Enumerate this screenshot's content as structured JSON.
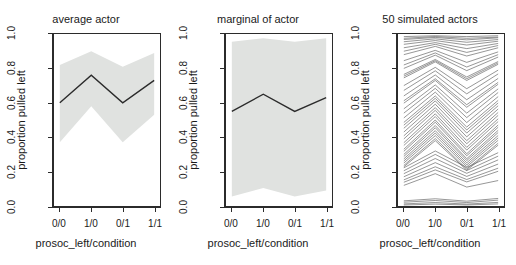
{
  "figure": {
    "background": "#ffffff",
    "line_color": "#2b2b2b",
    "band_color": "#e0e2e0",
    "spaghetti_color": "#4d4d4d"
  },
  "panels": [
    {
      "id": "average-actor",
      "title": "average actor",
      "xlabel": "prosoc_left/condition",
      "ylabel": "proportion pulled left"
    },
    {
      "id": "marginal-of-actor",
      "title": "marginal of actor",
      "xlabel": "prosoc_left/condition",
      "ylabel": "proportion pulled left"
    },
    {
      "id": "simulated-actors",
      "title": "50 simulated actors",
      "xlabel": "prosoc_left/condition",
      "ylabel": "proportion pulled left"
    }
  ],
  "axes": {
    "ytick_labels": [
      "0.0",
      "0.2",
      "0.4",
      "0.6",
      "0.8",
      "1.0"
    ],
    "ytick_values": [
      0.0,
      0.2,
      0.4,
      0.6,
      0.8,
      1.0
    ],
    "xtick_labels": [
      "0/0",
      "1/0",
      "0/1",
      "1/1"
    ],
    "ylim": [
      0.0,
      1.0
    ],
    "grid": false,
    "legend": "none"
  },
  "chart_data": [
    {
      "type": "line",
      "title": "average actor",
      "xlabel": "prosoc_left/condition",
      "ylabel": "proportion pulled left",
      "categories": [
        "0/0",
        "1/0",
        "0/1",
        "1/1"
      ],
      "ylim": [
        0.0,
        1.0
      ],
      "grid": false,
      "legend": "none",
      "series": [
        {
          "name": "posterior mean",
          "values": [
            0.6,
            0.76,
            0.6,
            0.73
          ]
        },
        {
          "name": "89% interval upper",
          "values": [
            0.82,
            0.9,
            0.81,
            0.89
          ]
        },
        {
          "name": "89% interval lower",
          "values": [
            0.37,
            0.58,
            0.37,
            0.53
          ]
        }
      ]
    },
    {
      "type": "line",
      "title": "marginal of actor",
      "xlabel": "prosoc_left/condition",
      "ylabel": "proportion pulled left",
      "categories": [
        "0/0",
        "1/0",
        "0/1",
        "1/1"
      ],
      "ylim": [
        0.0,
        1.0
      ],
      "grid": false,
      "legend": "none",
      "series": [
        {
          "name": "posterior mean",
          "values": [
            0.55,
            0.65,
            0.55,
            0.63
          ]
        },
        {
          "name": "89% interval upper",
          "values": [
            0.955,
            0.975,
            0.955,
            0.975
          ]
        },
        {
          "name": "89% interval lower",
          "values": [
            0.055,
            0.105,
            0.055,
            0.09
          ]
        }
      ]
    },
    {
      "type": "line",
      "title": "50 simulated actors",
      "xlabel": "prosoc_left/condition",
      "ylabel": "proportion pulled left",
      "categories": [
        "0/0",
        "1/0",
        "0/1",
        "1/1"
      ],
      "ylim": [
        0.0,
        1.0
      ],
      "grid": false,
      "legend": "none",
      "n_series": 50,
      "series": [
        {
          "name": "actor 1",
          "values": [
            0.985,
            0.99,
            0.985,
            0.99
          ]
        },
        {
          "name": "actor 2",
          "values": [
            0.975,
            0.985,
            0.975,
            0.982
          ]
        },
        {
          "name": "actor 3",
          "values": [
            0.968,
            0.98,
            0.966,
            0.978
          ]
        },
        {
          "name": "actor 4",
          "values": [
            0.955,
            0.972,
            0.952,
            0.968
          ]
        },
        {
          "name": "actor 5",
          "values": [
            0.94,
            0.962,
            0.936,
            0.958
          ]
        },
        {
          "name": "actor 6",
          "values": [
            0.92,
            0.95,
            0.915,
            0.945
          ]
        },
        {
          "name": "actor 7",
          "values": [
            0.9,
            0.94,
            0.893,
            0.933
          ]
        },
        {
          "name": "actor 8",
          "values": [
            0.88,
            0.928,
            0.872,
            0.92
          ]
        },
        {
          "name": "actor 9",
          "values": [
            0.845,
            0.905,
            0.835,
            0.896
          ]
        },
        {
          "name": "actor 10",
          "values": [
            0.82,
            0.89,
            0.808,
            0.88
          ]
        },
        {
          "name": "actor 11",
          "values": [
            0.8,
            0.877,
            0.787,
            0.866
          ]
        },
        {
          "name": "actor 12",
          "values": [
            0.765,
            0.852,
            0.75,
            0.84
          ]
        },
        {
          "name": "actor 13",
          "values": [
            0.755,
            0.845,
            0.74,
            0.832
          ]
        },
        {
          "name": "actor 14",
          "values": [
            0.745,
            0.838,
            0.73,
            0.824
          ]
        },
        {
          "name": "actor 15",
          "values": [
            0.7,
            0.806,
            0.682,
            0.79
          ]
        },
        {
          "name": "actor 16",
          "values": [
            0.672,
            0.786,
            0.652,
            0.768
          ]
        },
        {
          "name": "actor 17",
          "values": [
            0.64,
            0.762,
            0.618,
            0.742
          ]
        },
        {
          "name": "actor 18",
          "values": [
            0.612,
            0.74,
            0.589,
            0.719
          ]
        },
        {
          "name": "actor 19",
          "values": [
            0.598,
            0.73,
            0.574,
            0.708
          ]
        },
        {
          "name": "actor 20",
          "values": [
            0.565,
            0.704,
            0.54,
            0.681
          ]
        },
        {
          "name": "actor 21",
          "values": [
            0.54,
            0.684,
            0.514,
            0.66
          ]
        },
        {
          "name": "actor 22",
          "values": [
            0.512,
            0.662,
            0.485,
            0.636
          ]
        },
        {
          "name": "actor 23",
          "values": [
            0.486,
            0.64,
            0.459,
            0.614
          ]
        },
        {
          "name": "actor 24",
          "values": [
            0.47,
            0.626,
            0.442,
            0.599
          ]
        },
        {
          "name": "actor 25",
          "values": [
            0.452,
            0.611,
            0.424,
            0.583
          ]
        },
        {
          "name": "actor 26",
          "values": [
            0.43,
            0.592,
            0.402,
            0.564
          ]
        },
        {
          "name": "actor 27",
          "values": [
            0.408,
            0.572,
            0.38,
            0.544
          ]
        },
        {
          "name": "actor 28",
          "values": [
            0.39,
            0.556,
            0.362,
            0.527
          ]
        },
        {
          "name": "actor 29",
          "values": [
            0.368,
            0.536,
            0.341,
            0.507
          ]
        },
        {
          "name": "actor 30",
          "values": [
            0.352,
            0.52,
            0.325,
            0.491
          ]
        },
        {
          "name": "actor 31",
          "values": [
            0.33,
            0.5,
            0.304,
            0.471
          ]
        },
        {
          "name": "actor 32",
          "values": [
            0.318,
            0.487,
            0.292,
            0.458
          ]
        },
        {
          "name": "actor 33",
          "values": [
            0.3,
            0.468,
            0.275,
            0.44
          ]
        },
        {
          "name": "actor 34",
          "values": [
            0.288,
            0.455,
            0.264,
            0.427
          ]
        },
        {
          "name": "actor 35",
          "values": [
            0.274,
            0.438,
            0.251,
            0.41
          ]
        },
        {
          "name": "actor 36",
          "values": [
            0.262,
            0.424,
            0.239,
            0.396
          ]
        },
        {
          "name": "actor 37",
          "values": [
            0.25,
            0.409,
            0.228,
            0.382
          ]
        },
        {
          "name": "actor 38",
          "values": [
            0.236,
            0.392,
            0.215,
            0.365
          ]
        },
        {
          "name": "actor 39",
          "values": [
            0.228,
            0.38,
            0.208,
            0.354
          ]
        },
        {
          "name": "actor 40",
          "values": [
            0.222,
            0.32,
            0.224,
            0.31
          ]
        },
        {
          "name": "actor 41",
          "values": [
            0.205,
            0.3,
            0.206,
            0.29
          ]
        },
        {
          "name": "actor 42",
          "values": [
            0.188,
            0.276,
            0.19,
            0.268
          ]
        },
        {
          "name": "actor 43",
          "values": [
            0.17,
            0.252,
            0.172,
            0.244
          ]
        },
        {
          "name": "actor 44",
          "values": [
            0.152,
            0.228,
            0.154,
            0.22
          ]
        },
        {
          "name": "actor 45",
          "values": [
            0.138,
            0.21,
            0.14,
            0.202
          ]
        },
        {
          "name": "actor 46",
          "values": [
            0.12,
            0.188,
            0.11,
            0.148
          ]
        },
        {
          "name": "actor 47",
          "values": [
            0.03,
            0.042,
            0.028,
            0.044
          ]
        },
        {
          "name": "actor 48",
          "values": [
            0.022,
            0.032,
            0.02,
            0.034
          ]
        },
        {
          "name": "actor 49",
          "values": [
            0.012,
            0.02,
            0.011,
            0.021
          ]
        },
        {
          "name": "actor 50",
          "values": [
            0.006,
            0.011,
            0.006,
            0.012
          ]
        }
      ]
    }
  ]
}
